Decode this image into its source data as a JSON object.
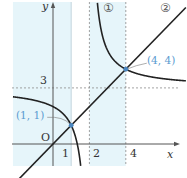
{
  "diagram": {
    "type": "function-graph",
    "axes": {
      "x_label": "x",
      "y_label": "y",
      "origin_label": "O",
      "x_ticks": [
        {
          "value": 1,
          "label": "1",
          "line": "solid"
        },
        {
          "value": 2,
          "label": "2",
          "line": "dashed"
        },
        {
          "value": 4,
          "label": "4",
          "line": "dashed"
        }
      ],
      "y_ticks": [
        {
          "value": 3,
          "label": "3",
          "line": "dashed"
        }
      ],
      "x_range": [
        -2.2,
        7.4
      ],
      "y_range": [
        -1.1,
        7.7
      ]
    },
    "shaded_bands": [
      {
        "x_from": -2.2,
        "x_to": 1
      },
      {
        "x_from": 2,
        "x_to": 4
      }
    ],
    "curves": [
      {
        "id": "1",
        "label": "①",
        "kind": "hyperbola",
        "equation": "y = 3 + 2/(x - 2)",
        "asymptotes": {
          "x": 2,
          "y": 3
        },
        "k": 2
      },
      {
        "id": "2",
        "label": "②",
        "kind": "line",
        "equation": "y = x",
        "slope": 1,
        "intercept": 0
      }
    ],
    "points": [
      {
        "x": 1,
        "y": 1,
        "label": "(1, 1)"
      },
      {
        "x": 4,
        "y": 4,
        "label": "(4, 4)"
      }
    ],
    "colors": {
      "curve": "#222222",
      "axis": "#555555",
      "guide": "#8a8a8a",
      "band": "#e6f5fa",
      "point": "#4a86c0",
      "point_label": "#5a9bd0"
    }
  }
}
